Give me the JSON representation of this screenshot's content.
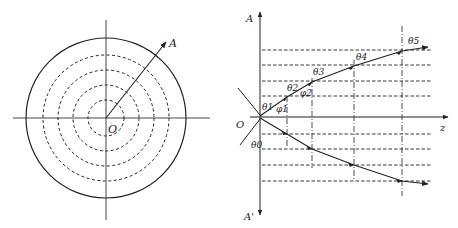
{
  "left_panel": {
    "center_label": "O",
    "ray_label": "A",
    "solid_circle": "outer boundary",
    "dashed_circles": 4
  },
  "right_panel": {
    "vertical_axis_top_label": "A",
    "vertical_axis_bottom_label": "A'",
    "horizontal_axis_label": "z",
    "origin_label": "O",
    "angle_labels": {
      "theta0": "θ0",
      "theta1": "θ1",
      "phi1": "φ1",
      "theta2": "θ2",
      "phi2": "φ2",
      "theta3": "θ3",
      "theta4": "θ4",
      "theta5": "θ5"
    },
    "upper_dashed_levels": 4,
    "lower_dashed_levels": 4,
    "vertical_dashdot_lines": 4
  },
  "colors": {
    "stroke": "#222222",
    "background": "#ffffff"
  }
}
